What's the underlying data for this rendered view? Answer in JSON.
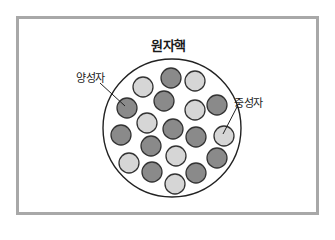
{
  "diagram": {
    "title": "원자핵",
    "labels": {
      "proton": "양성자",
      "neutron": "중성자"
    },
    "colors": {
      "frame_border": "#a8a8a8",
      "proton_fill": "#8a8a8a",
      "neutron_fill": "#d6d6d6",
      "outline": "#333333"
    },
    "nucleus": {
      "cx": 172,
      "cy": 128,
      "r": 69
    },
    "particle_radius": 10,
    "particles": [
      {
        "type": "proton",
        "cx": 171,
        "cy": 78
      },
      {
        "type": "neutron",
        "cx": 195,
        "cy": 81
      },
      {
        "type": "neutron",
        "cx": 143,
        "cy": 87
      },
      {
        "type": "proton",
        "cx": 164,
        "cy": 101
      },
      {
        "type": "proton",
        "cx": 217,
        "cy": 105
      },
      {
        "type": "neutron",
        "cx": 195,
        "cy": 110
      },
      {
        "type": "proton",
        "cx": 127,
        "cy": 108
      },
      {
        "type": "neutron",
        "cx": 147,
        "cy": 123
      },
      {
        "type": "proton",
        "cx": 173,
        "cy": 129
      },
      {
        "type": "proton",
        "cx": 196,
        "cy": 137
      },
      {
        "type": "neutron",
        "cx": 224,
        "cy": 136
      },
      {
        "type": "proton",
        "cx": 121,
        "cy": 135
      },
      {
        "type": "proton",
        "cx": 151,
        "cy": 146
      },
      {
        "type": "neutron",
        "cx": 176,
        "cy": 156
      },
      {
        "type": "proton",
        "cx": 217,
        "cy": 158
      },
      {
        "type": "neutron",
        "cx": 129,
        "cy": 163
      },
      {
        "type": "proton",
        "cx": 152,
        "cy": 172
      },
      {
        "type": "proton",
        "cx": 196,
        "cy": 173
      },
      {
        "type": "neutron",
        "cx": 175,
        "cy": 184
      }
    ],
    "leaders": {
      "proton": {
        "x1": 100,
        "y1": 83,
        "x2": 125,
        "y2": 106
      },
      "neutron": {
        "x1": 237,
        "y1": 107,
        "x2": 223,
        "y2": 134
      }
    }
  }
}
